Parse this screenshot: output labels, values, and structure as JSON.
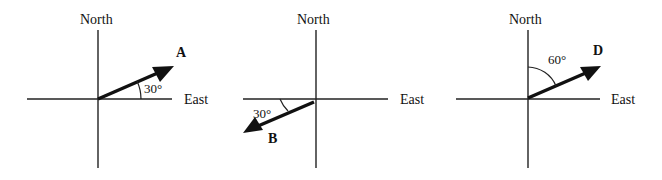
{
  "figure": {
    "panels": [
      {
        "north_label": "North",
        "east_label": "East",
        "vector_label": "A",
        "angle_label": "30°",
        "angle_reference": "East",
        "direction": "30° north of east"
      },
      {
        "north_label": "North",
        "east_label": "East",
        "vector_label": "B",
        "angle_label": "30°",
        "angle_reference": "West",
        "direction": "30° south of west"
      },
      {
        "north_label": "North",
        "east_label": "East",
        "vector_label": "D",
        "angle_label": "60°",
        "angle_reference": "North",
        "direction": "60° east of north"
      }
    ]
  }
}
